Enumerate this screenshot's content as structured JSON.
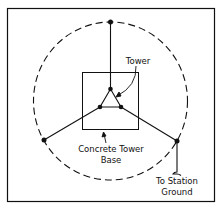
{
  "diagram": {
    "labels": {
      "tower": "Tower",
      "base_line1": "Concrete Tower",
      "base_line2": "Base",
      "ground_line1": "To Station",
      "ground_line2": "Ground"
    },
    "colors": {
      "stroke": "#111111",
      "background": "#ffffff"
    }
  }
}
